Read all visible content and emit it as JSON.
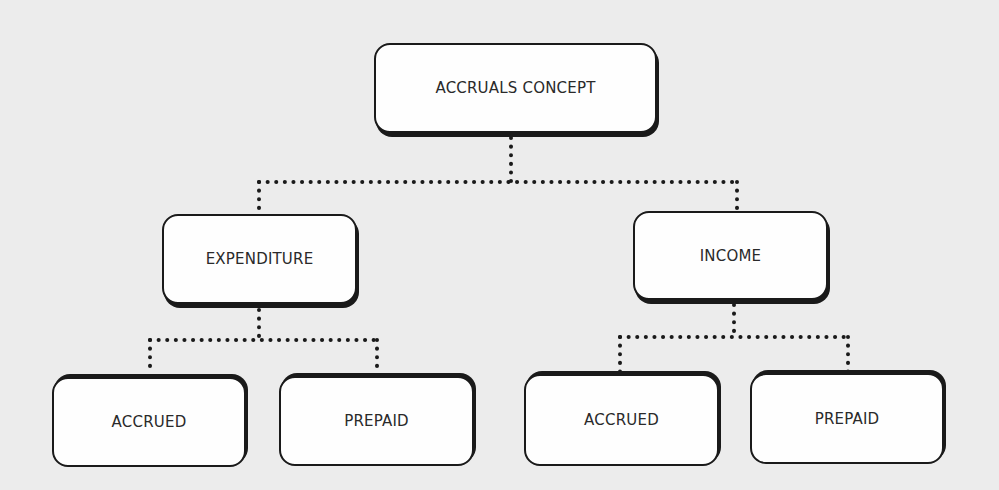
{
  "diagram": {
    "root": {
      "label": "ACCRUALS CONCEPT"
    },
    "branches": [
      {
        "label": "EXPENDITURE",
        "children": [
          {
            "label": "ACCRUED"
          },
          {
            "label": "PREPAID"
          }
        ]
      },
      {
        "label": "INCOME",
        "children": [
          {
            "label": "ACCRUED"
          },
          {
            "label": "PREPAID"
          }
        ]
      }
    ],
    "connector_style": "dotted",
    "colors": {
      "background": "#ececec",
      "box_fill": "#fefefe",
      "stroke": "#1a1a1a",
      "text": "#2a2a2a"
    }
  }
}
